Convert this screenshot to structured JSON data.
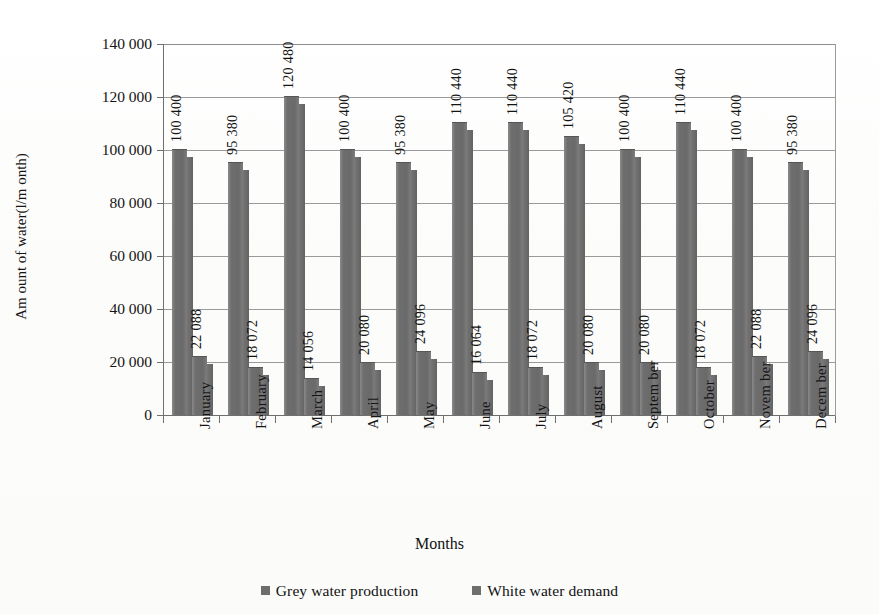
{
  "chart_data": {
    "type": "bar",
    "title": "",
    "xlabel": "Months",
    "ylabel": "Am ount of water(l/m onth)",
    "categories": [
      "January",
      "February",
      "March",
      "April",
      "May",
      "June",
      "July",
      "August",
      "Septem ber",
      "October",
      "Novem ber",
      "Decem ber"
    ],
    "series": [
      {
        "name": "Grey water production",
        "values": [
          100400,
          95380,
          120480,
          100400,
          95380,
          110440,
          110440,
          105420,
          100400,
          110440,
          100400,
          95380
        ],
        "labels": [
          "100 400",
          "95 380",
          "120 480",
          "100 400",
          "95 380",
          "110 440",
          "110 440",
          "105 420",
          "100 400",
          "110 440",
          "100 400",
          "95 380"
        ],
        "color": "#6e6e6e"
      },
      {
        "name": "White water demand",
        "values": [
          22088,
          18072,
          14056,
          20080,
          24096,
          16064,
          18072,
          20080,
          20080,
          18072,
          22088,
          24096
        ],
        "labels": [
          "22 088",
          "18 072",
          "14 056",
          "20 080",
          "24 096",
          "16 064",
          "18 072",
          "20 080",
          "20 080",
          "18 072",
          "22 088",
          "24 096"
        ],
        "color": "#6e6e6e"
      }
    ],
    "ylim": [
      0,
      140000
    ],
    "ytick_values": [
      0,
      20000,
      40000,
      60000,
      80000,
      100000,
      120000,
      140000
    ],
    "ytick_labels": [
      "0",
      "20 000",
      "40 000",
      "60 000",
      "80 000",
      "100 000",
      "120 000",
      "140 000"
    ],
    "grid": true,
    "legend_position": "bottom",
    "bar_color": "#6e6e6e",
    "gridline_color": "#9a9a9a",
    "axis_color": "#6f6f6f",
    "background": "#ffffff"
  },
  "legend": {
    "items": [
      {
        "label": "Grey water production",
        "swatch": "legend-swatch-grey-water"
      },
      {
        "label": "White water demand",
        "swatch": "legend-swatch-white-water"
      }
    ]
  }
}
